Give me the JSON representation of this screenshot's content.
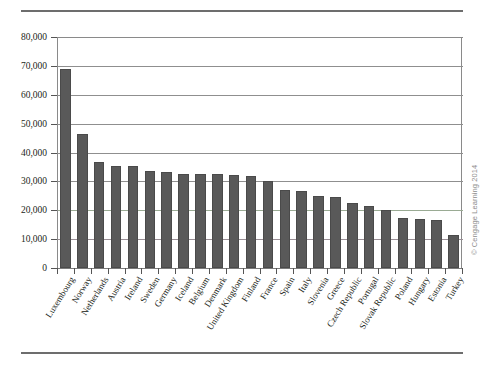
{
  "figure": {
    "credit": "© Cengage Learning 2014"
  },
  "chart_data": {
    "type": "bar",
    "title": "",
    "subtitle": "",
    "xlabel": "",
    "ylabel": "",
    "ylim": [
      0,
      80000
    ],
    "ytick_step": 10000,
    "grid": true,
    "legend": null,
    "bar_color": "#595959",
    "gridline_color": "#8f8f8f",
    "accent_gridlines": {
      "20000": "#9aab94",
      "10000": "#9a8f96"
    },
    "ytick_labels": [
      "0",
      "10,000",
      "20,000",
      "30,000",
      "40,000",
      "50,000",
      "60,000",
      "70,000",
      "80,000"
    ],
    "ytick_values": [
      0,
      10000,
      20000,
      30000,
      40000,
      50000,
      60000,
      70000,
      80000
    ],
    "categories": [
      "Luxembourg",
      "Norway",
      "Netherlands",
      "Austria",
      "Ireland",
      "Sweden",
      "Germany",
      "Iceland",
      "Belgium",
      "Denmark",
      "United Kingdom",
      "Finland",
      "France",
      "Spain",
      "Italy",
      "Slovenia",
      "Greece",
      "Czech Republic",
      "Portugal",
      "Slovak Republic",
      "Poland",
      "Hungary",
      "Estonia",
      "Turkey"
    ],
    "values": [
      68800,
      46500,
      36800,
      35500,
      35200,
      33700,
      33200,
      32700,
      32600,
      32400,
      32200,
      31900,
      30000,
      27000,
      26800,
      24800,
      24500,
      22600,
      21500,
      20000,
      17300,
      16900,
      16500,
      11500
    ]
  }
}
